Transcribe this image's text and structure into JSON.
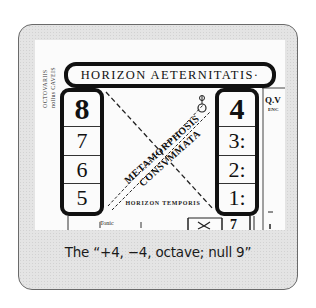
{
  "figure": {
    "header_label": "HORIZON AETERNITATIS·",
    "vertical_label": [
      "OCTOVARIIS",
      "nollus CAVEIS"
    ],
    "left_column": [
      "8",
      "7",
      "6",
      "5"
    ],
    "right_column": [
      "4",
      "3:",
      "2:",
      "1:"
    ],
    "diagonal_text": [
      "METAMORPHOSIS",
      "CONSVMMATA"
    ],
    "bottom_label": "HORIZON TEMPORIS",
    "side_note": "Q.V",
    "side_note_sub": "ENC",
    "bottom_strip_label": "Tonic",
    "bottom_strip_glyph": "7"
  },
  "caption": "The “+4, −4, octave; null 9”"
}
